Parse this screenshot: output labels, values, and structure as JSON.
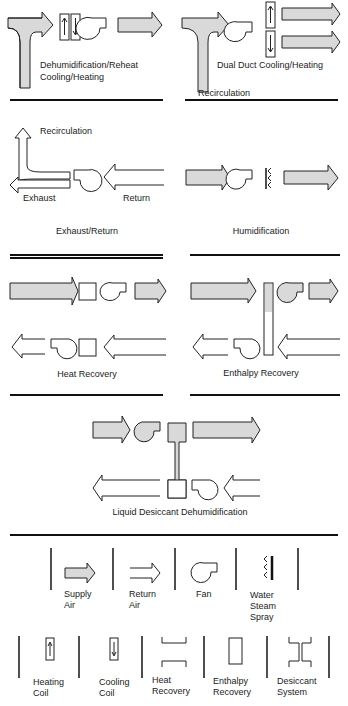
{
  "colors": {
    "stroke": "#222222",
    "supply_fill": "#d9d9d9",
    "background": "#ffffff"
  },
  "panels": {
    "dehumid_reheat": {
      "caption_line1": "Dehumidification/Reheat",
      "caption_line2": "Cooling/Heating"
    },
    "dual_duct": {
      "caption": "Dual Duct Cooling/Heating",
      "recirculation_label": "Recirculation"
    },
    "exhaust_return": {
      "caption": "Exhaust/Return",
      "recirculation_label": "Recirculation",
      "exhaust_label": "Exhaust",
      "return_label": "Return"
    },
    "humidification": {
      "caption": "Humidification"
    },
    "heat_recovery": {
      "caption": "Heat Recovery"
    },
    "enthalpy_recovery": {
      "caption": "Enthalpy Recovery"
    },
    "liquid_desiccant": {
      "caption": "Liquid Desiccant Dehumidification"
    }
  },
  "legend": {
    "row1": [
      {
        "icon": "supply-air-arrow",
        "line1": "Supply",
        "line2": "Air"
      },
      {
        "icon": "return-air-arrow",
        "line1": "Return",
        "line2": "Air"
      },
      {
        "icon": "fan-icon",
        "line1": "Fan",
        "line2": ""
      },
      {
        "icon": "water-steam-spray-icon",
        "line1": "Water",
        "line2": "Steam",
        "line3": "Spray"
      }
    ],
    "row2": [
      {
        "icon": "heating-coil-icon",
        "line1": "Heating",
        "line2": "Coil"
      },
      {
        "icon": "cooling-coil-icon",
        "line1": "Cooling",
        "line2": "Coil"
      },
      {
        "icon": "heat-recovery-icon",
        "line1": "Heat",
        "line2": "Recovery"
      },
      {
        "icon": "enthalpy-recovery-icon",
        "line1": "Enthalpy",
        "line2": "Recovery"
      },
      {
        "icon": "desiccant-system-icon",
        "line1": "Desiccant",
        "line2": "System"
      }
    ]
  }
}
